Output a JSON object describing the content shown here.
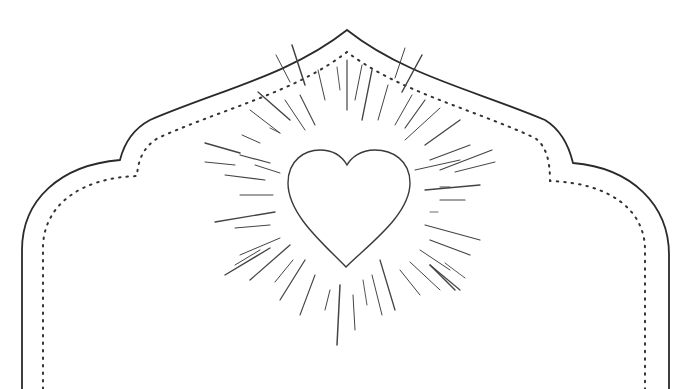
{
  "image": {
    "description": "Line-art frame with arched onion-dome top, dotted inner border, and a heart with radiating sunburst rays",
    "elements": [
      "outer-frame",
      "inner-dotted-frame",
      "heart",
      "sunburst-rays"
    ]
  },
  "colors": {
    "background": "#ffffff",
    "outer_stroke": "#2a2a2a",
    "dotted_stroke": "#333333",
    "heart_stroke": "#3a3a3a",
    "ray_stroke": "#444444"
  }
}
